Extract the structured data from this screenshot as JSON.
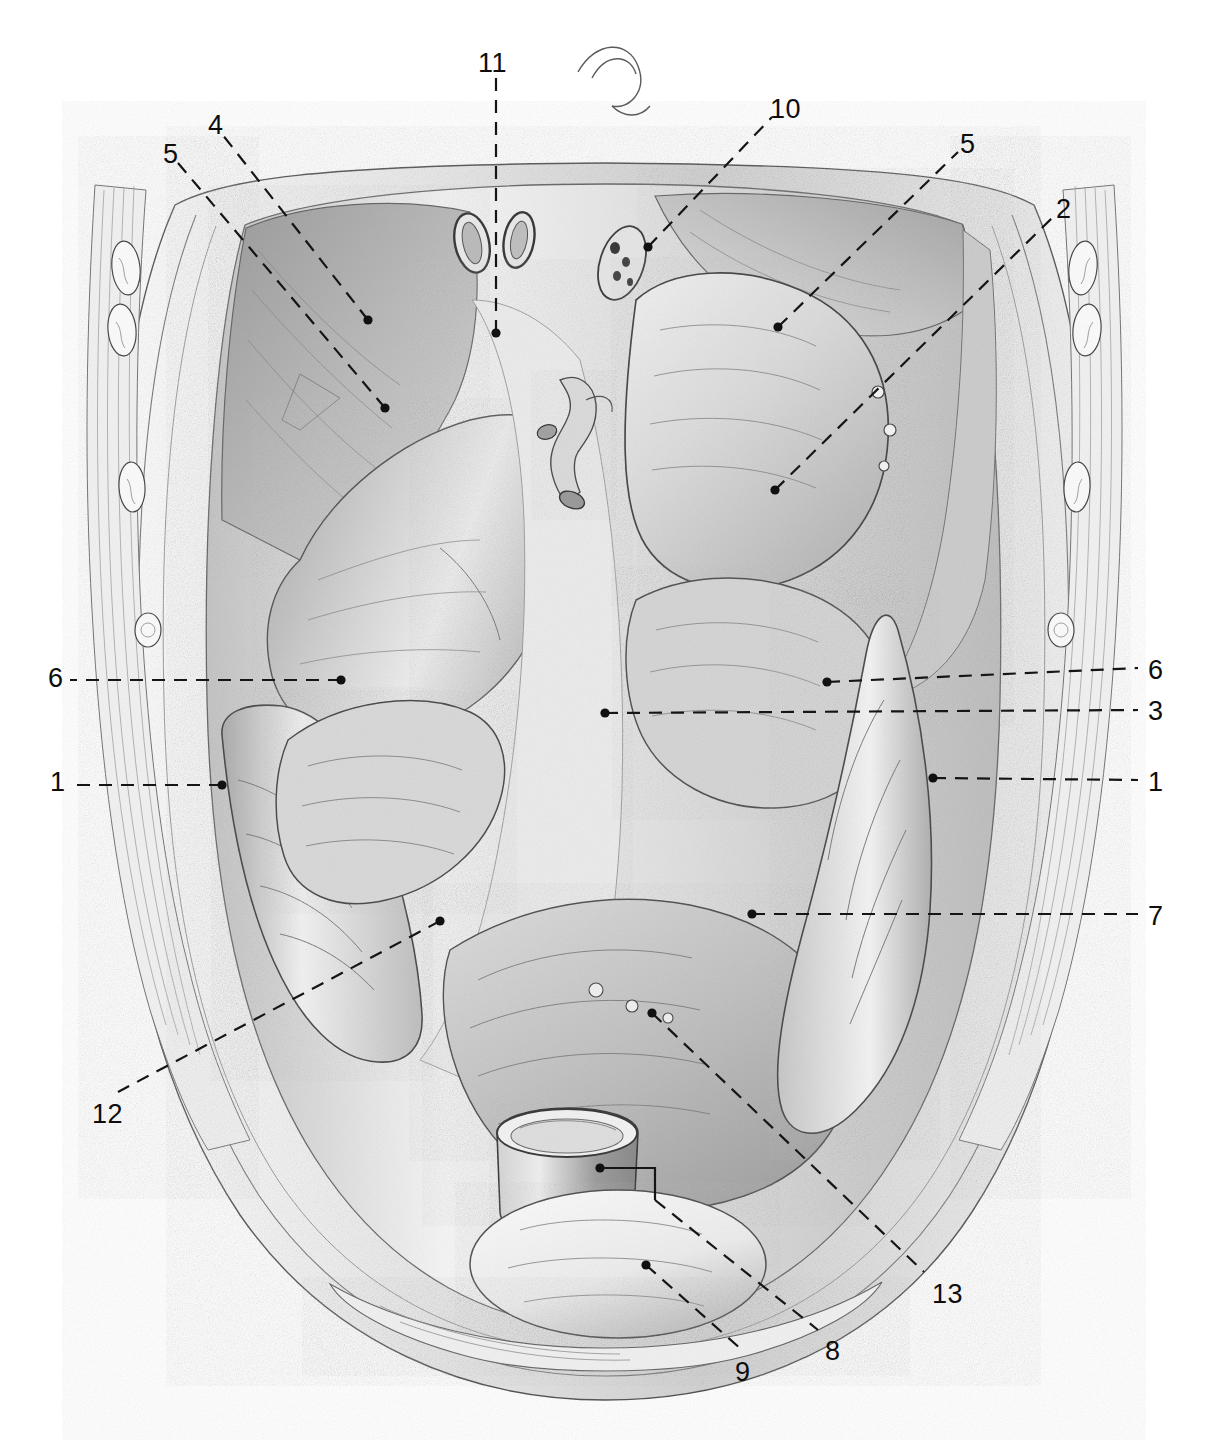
{
  "figure": {
    "background_color": "#ffffff",
    "ink_color": "#111111",
    "mid_tone": "#b4b4b4",
    "shadow_tone": "#8f8f8f",
    "highlight_tone": "#f4f4f4",
    "leader_style": "dashed",
    "view": "anterior view of opened abdominal cavity"
  },
  "labels": [
    {
      "id": "11",
      "text": "11",
      "x": 478,
      "y": 50,
      "dot_x": 496,
      "dot_y": 333,
      "leader": "vertical-dashed"
    },
    {
      "id": "10",
      "text": "10",
      "x": 770,
      "y": 96,
      "dot_x": 648,
      "dot_y": 247,
      "leader": "diagonal-dashed"
    },
    {
      "id": "4",
      "text": "4",
      "x": 208,
      "y": 112,
      "dot_x": 368,
      "dot_y": 320,
      "leader": "diagonal-dashed"
    },
    {
      "id": "5L",
      "text": "5",
      "x": 163,
      "y": 141,
      "dot_x": 385,
      "dot_y": 408,
      "leader": "diagonal-dashed"
    },
    {
      "id": "5R",
      "text": "5",
      "x": 960,
      "y": 131,
      "dot_x": 778,
      "dot_y": 327,
      "leader": "diagonal-dashed"
    },
    {
      "id": "2",
      "text": "2",
      "x": 1056,
      "y": 196,
      "dot_x": 775,
      "dot_y": 490,
      "leader": "diagonal-dashed"
    },
    {
      "id": "6L",
      "text": "6",
      "x": 48,
      "y": 665,
      "dot_x": 341,
      "dot_y": 680,
      "leader": "horizontal-dashed"
    },
    {
      "id": "6R",
      "text": "6",
      "x": 1148,
      "y": 657,
      "dot_x": 827,
      "dot_y": 682,
      "leader": "horizontal-dashed"
    },
    {
      "id": "3",
      "text": "3",
      "x": 1148,
      "y": 698,
      "dot_x": 605,
      "dot_y": 713,
      "leader": "horizontal-dashed"
    },
    {
      "id": "1L",
      "text": "1",
      "x": 50,
      "y": 769,
      "dot_x": 222,
      "dot_y": 785,
      "leader": "horizontal-dashed"
    },
    {
      "id": "1R",
      "text": "1",
      "x": 1148,
      "y": 769,
      "dot_x": 933,
      "dot_y": 778,
      "leader": "horizontal-dashed"
    },
    {
      "id": "7",
      "text": "7",
      "x": 1148,
      "y": 903,
      "dot_x": 752,
      "dot_y": 914,
      "leader": "horizontal-dashed"
    },
    {
      "id": "12",
      "text": "12",
      "x": 92,
      "y": 1101,
      "dot_x": 440,
      "dot_y": 921,
      "leader": "diagonal-dashed"
    },
    {
      "id": "13",
      "text": "13",
      "x": 932,
      "y": 1281,
      "dot_x": 652,
      "dot_y": 1013,
      "leader": "diagonal-dashed"
    },
    {
      "id": "8",
      "text": "8",
      "x": 825,
      "y": 1338,
      "dot_x": 600,
      "dot_y": 1168,
      "leader": "elbow-dashed"
    },
    {
      "id": "9",
      "text": "9",
      "x": 735,
      "y": 1359,
      "dot_x": 646,
      "dot_y": 1265,
      "leader": "diagonal-dashed"
    }
  ],
  "leader_paths": {
    "11": "M496,333 L496,70",
    "10": "M648,247 L772,117",
    "4": "M368,320 L222,134",
    "5L": "M385,408 L178,163",
    "5R": "M778,327 L958,152",
    "2": "M775,490 L1052,218",
    "6L": "M341,680 L70,680",
    "6R": "M827,682 L1138,668",
    "3": "M605,713 L1138,710",
    "1L": "M222,785 L72,785",
    "1R": "M933,778 L1138,780",
    "7": "M752,914 L1138,914",
    "12": "M440,921 L118,1092",
    "13": "M652,1013 L924,1272",
    "8": "M600,1168 L655,1168 L655,1200 L818,1330",
    "9": "M646,1265 L742,1350"
  },
  "figure_regions": [
    {
      "name": "diaphragm-dome-right",
      "note": "upper-left shaded dome of diaphragm"
    },
    {
      "name": "diaphragm-dome-left",
      "note": "upper-right shaded dome of diaphragm"
    },
    {
      "name": "liver-right-lobe",
      "note": "large mid-left organ mass"
    },
    {
      "name": "stomach",
      "note": "central-right organ with greater curvature"
    },
    {
      "name": "transverse-colon",
      "note": "band crossing centre"
    },
    {
      "name": "small-intestine-coils",
      "note": "lower central coils"
    },
    {
      "name": "ascending-colon",
      "note": "left margin vertical band"
    },
    {
      "name": "descending-colon",
      "note": "right margin vertical band"
    },
    {
      "name": "cut-bowel-stump",
      "note": "cut cylindrical stump low centre"
    },
    {
      "name": "urinary-bladder",
      "note": "rounded mass at bottom centre"
    },
    {
      "name": "abdominal-wall-ribs-left",
      "note": "cut costal cartilages, left margin"
    },
    {
      "name": "abdominal-wall-ribs-right",
      "note": "cut costal cartilages, right margin"
    },
    {
      "name": "oesophagus-aorta-hiatus",
      "note": "two ring openings at top centre"
    },
    {
      "name": "vessel-stumps",
      "note": "cut tubular vessels centre top"
    }
  ]
}
